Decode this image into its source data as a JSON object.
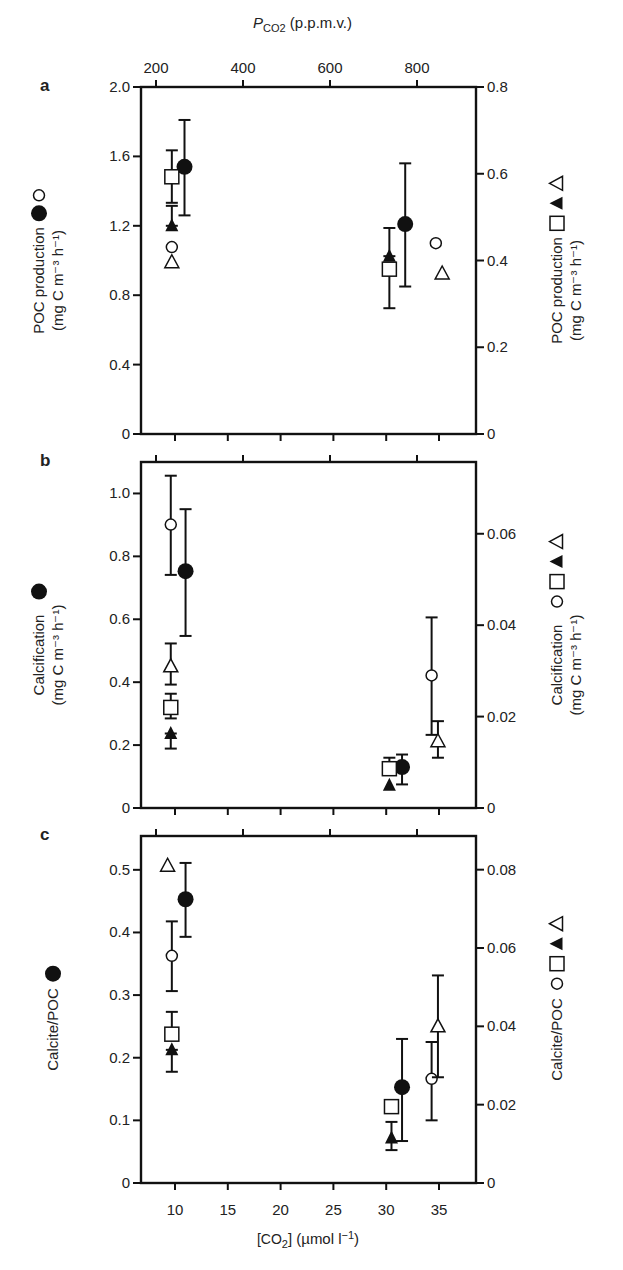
{
  "figure": {
    "top_axis": {
      "title_main": "P",
      "title_sub": "CO2",
      "title_rest": " (p.p.m.v.)",
      "ticks": [
        200,
        400,
        600,
        800
      ]
    },
    "bottom_axis": {
      "title": "[CO2] (µmol l−1)",
      "title_parts": [
        "[CO",
        "2",
        "] (µmol l",
        "−1",
        ")"
      ],
      "ticks": [
        10,
        15,
        20,
        25,
        30,
        35
      ]
    }
  },
  "chart_data": [
    {
      "panel": "a",
      "type": "scatter",
      "title": "",
      "xlabel": "[CO2] (µmol l−1)",
      "x2label": "PCO2 (p.p.m.v.)",
      "ylabel_left": "POC production ● ○ (mg C m−3 h−1)",
      "ylabel_right": "POC production □ ▲ △ (mg C m−3 h−1)",
      "left_label_lines": [
        "POC production",
        "(mg C m⁻³ h⁻¹)"
      ],
      "left_label_symbols": [
        "filled-circle",
        "open-circle"
      ],
      "right_label_lines": [
        "POC production",
        "(mg C m⁻³ h⁻¹)"
      ],
      "right_label_symbols": [
        "open-square",
        "filled-triangle",
        "open-triangle"
      ],
      "ylim_left": [
        0,
        2.0
      ],
      "ylim_right": [
        0,
        0.8
      ],
      "yticks_left": [
        "0",
        "0.4",
        "0.8",
        "1.2",
        "1.6",
        "2.0"
      ],
      "yticks_right": [
        "0",
        "0.2",
        "0.4",
        "0.6",
        "0.8"
      ],
      "yticks_left_values": [
        0,
        0.4,
        0.8,
        1.2,
        1.6,
        2.0
      ],
      "yticks_right_values": [
        0,
        0.2,
        0.4,
        0.6,
        0.8
      ],
      "grid": false,
      "series": [
        {
          "name": "filled circle",
          "marker": "filled-circle",
          "axis": "left",
          "points": [
            {
              "x": 10.9,
              "y": 1.54,
              "err_low": 1.26,
              "err_high": 1.81
            },
            {
              "x": 31.8,
              "y": 1.21,
              "err_low": 0.85,
              "err_high": 1.56
            }
          ]
        },
        {
          "name": "open circle",
          "marker": "open-circle",
          "axis": "right",
          "points": [
            {
              "x": 9.7,
              "y": 0.431
            },
            {
              "x": 34.7,
              "y": 0.44
            }
          ]
        },
        {
          "name": "open square",
          "marker": "open-square",
          "axis": "right",
          "points": [
            {
              "x": 9.7,
              "y": 0.593,
              "err_low": 0.533,
              "err_high": 0.654
            },
            {
              "x": 30.3,
              "y": 0.38,
              "err_low": 0.29,
              "err_high": 0.38
            }
          ]
        },
        {
          "name": "filled triangle",
          "marker": "filled-triangle",
          "axis": "right",
          "points": [
            {
              "x": 9.7,
              "y": 0.48,
              "err_low": 0.48,
              "err_high": 0.526
            },
            {
              "x": 30.3,
              "y": 0.41,
              "err_low": 0.41,
              "err_high": 0.475
            }
          ]
        },
        {
          "name": "open triangle",
          "marker": "open-triangle",
          "axis": "right",
          "points": [
            {
              "x": 9.7,
              "y": 0.396
            },
            {
              "x": 35.3,
              "y": 0.37
            }
          ]
        }
      ]
    },
    {
      "panel": "b",
      "type": "scatter",
      "title": "",
      "xlabel": "[CO2] (µmol l−1)",
      "ylabel_left": "Calcification ● (mg C m−3 h−1)",
      "ylabel_right": "Calcification ○ □ ▲ △ (mg C m−3 h−1)",
      "left_label_lines": [
        "Calcification",
        "(mg C m⁻³ h⁻¹)"
      ],
      "left_label_symbols": [
        "filled-circle"
      ],
      "right_label_lines": [
        "Calcification",
        "(mg C m⁻³ h⁻¹)"
      ],
      "right_label_symbols": [
        "open-circle",
        "open-square",
        "filled-triangle",
        "open-triangle"
      ],
      "ylim_left": [
        0,
        1.1
      ],
      "ylim_right": [
        0,
        0.0757
      ],
      "yticks_left": [
        "0",
        "0.2",
        "0.4",
        "0.6",
        "0.8",
        "1.0"
      ],
      "yticks_right": [
        "0",
        "0.02",
        "0.04",
        "0.06"
      ],
      "yticks_left_values": [
        0,
        0.2,
        0.4,
        0.6,
        0.8,
        1.0
      ],
      "yticks_right_values": [
        0,
        0.02,
        0.04,
        0.06
      ],
      "grid": false,
      "series": [
        {
          "name": "filled circle",
          "marker": "filled-circle",
          "axis": "left",
          "points": [
            {
              "x": 11.0,
              "y": 0.753,
              "err_low": 0.547,
              "err_high": 0.95
            },
            {
              "x": 31.5,
              "y": 0.13,
              "err_low": 0.075,
              "err_high": 0.17
            }
          ]
        },
        {
          "name": "open circle",
          "marker": "open-circle",
          "axis": "right",
          "points": [
            {
              "x": 9.6,
              "y": 0.062,
              "err_low": 0.051,
              "err_high": 0.0727
            },
            {
              "x": 34.3,
              "y": 0.029,
              "err_low": 0.016,
              "err_high": 0.0417
            }
          ]
        },
        {
          "name": "open square",
          "marker": "open-square",
          "axis": "right",
          "points": [
            {
              "x": 9.6,
              "y": 0.022,
              "err_low": 0.0196,
              "err_high": 0.025
            },
            {
              "x": 30.3,
              "y": 0.0086,
              "err_low": 0.0086,
              "err_high": 0.011
            }
          ]
        },
        {
          "name": "filled triangle",
          "marker": "filled-triangle",
          "axis": "right",
          "points": [
            {
              "x": 9.6,
              "y": 0.0163,
              "err_low": 0.013,
              "err_high": 0.0163
            },
            {
              "x": 30.3,
              "y": 0.005
            }
          ]
        },
        {
          "name": "open triangle",
          "marker": "open-triangle",
          "axis": "right",
          "points": [
            {
              "x": 9.6,
              "y": 0.031,
              "err_low": 0.027,
              "err_high": 0.036
            },
            {
              "x": 34.9,
              "y": 0.0146,
              "err_low": 0.011,
              "err_high": 0.019
            }
          ]
        }
      ]
    },
    {
      "panel": "c",
      "type": "scatter",
      "title": "",
      "xlabel": "[CO2] (µmol l−1)",
      "ylabel_left": "Calcite/POC ●",
      "ylabel_right": "Calcite/POC ○ □ ▲ △",
      "left_label_lines": [
        "Calcite/POC"
      ],
      "left_label_symbols": [
        "filled-circle"
      ],
      "right_label_lines": [
        "Calcite/POC"
      ],
      "right_label_symbols": [
        "open-circle",
        "open-square",
        "filled-triangle",
        "open-triangle"
      ],
      "ylim_left": [
        0,
        0.554
      ],
      "ylim_right": [
        0,
        0.0886
      ],
      "yticks_left": [
        "0",
        "0.1",
        "0.2",
        "0.3",
        "0.4",
        "0.5"
      ],
      "yticks_right": [
        "0",
        "0.02",
        "0.04",
        "0.06",
        "0.08"
      ],
      "yticks_left_values": [
        0,
        0.1,
        0.2,
        0.3,
        0.4,
        0.5
      ],
      "yticks_right_values": [
        0,
        0.02,
        0.04,
        0.06,
        0.08
      ],
      "grid": false,
      "series": [
        {
          "name": "filled circle",
          "marker": "filled-circle",
          "axis": "left",
          "points": [
            {
              "x": 11.0,
              "y": 0.453,
              "err_low": 0.393,
              "err_high": 0.511
            },
            {
              "x": 31.5,
              "y": 0.153,
              "err_low": 0.067,
              "err_high": 0.23
            }
          ]
        },
        {
          "name": "open circle",
          "marker": "open-circle",
          "axis": "right",
          "points": [
            {
              "x": 9.7,
              "y": 0.058,
              "err_low": 0.049,
              "err_high": 0.0668
            },
            {
              "x": 34.3,
              "y": 0.0266,
              "err_low": 0.016,
              "err_high": 0.036
            }
          ]
        },
        {
          "name": "open square",
          "marker": "open-square",
          "axis": "right",
          "points": [
            {
              "x": 9.7,
              "y": 0.038,
              "err_low": 0.0366,
              "err_high": 0.0437
            },
            {
              "x": 30.5,
              "y": 0.0195
            }
          ]
        },
        {
          "name": "filled triangle",
          "marker": "filled-triangle",
          "axis": "right",
          "points": [
            {
              "x": 9.7,
              "y": 0.034,
              "err_low": 0.0284,
              "err_high": 0.034
            },
            {
              "x": 30.5,
              "y": 0.0115,
              "err_low": 0.0084,
              "err_high": 0.0156
            }
          ]
        },
        {
          "name": "open triangle",
          "marker": "open-triangle",
          "axis": "right",
          "points": [
            {
              "x": 9.3,
              "y": 0.081
            },
            {
              "x": 34.9,
              "y": 0.04,
              "err_low": 0.027,
              "err_high": 0.053
            }
          ]
        }
      ]
    }
  ]
}
